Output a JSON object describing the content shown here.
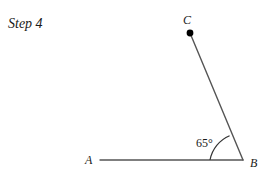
{
  "caption": {
    "text": "Step 4"
  },
  "figure": {
    "name": "angle-construction-65-degrees",
    "points": {
      "A": {
        "label": "A",
        "x": 100,
        "y": 160,
        "label_x": 85,
        "label_y": 164,
        "marker": false
      },
      "B": {
        "label": "B",
        "x": 243,
        "y": 160,
        "label_x": 250,
        "label_y": 167,
        "marker": false
      },
      "C": {
        "label": "C",
        "x": 190,
        "y": 33,
        "label_x": 183,
        "label_y": 24,
        "marker": true,
        "marker_radius": 3.4
      }
    },
    "segments": [
      {
        "name": "ray-BA",
        "from": "B",
        "to": "A"
      },
      {
        "name": "ray-BC",
        "from": "B",
        "to": "C"
      }
    ],
    "angle": {
      "label": "65°",
      "value": 65,
      "unit": "degrees",
      "vertex": "B",
      "label_x": 196,
      "label_y": 147,
      "arc_radius": 33,
      "arc_start_x": 210,
      "arc_start_y": 160,
      "arc_end_x": 229.6,
      "arc_end_y": 135.8
    },
    "colors": {
      "segment": "#555555",
      "arc": "#333333",
      "point": "#000000",
      "text": "#1a1a1a",
      "background": "#ffffff"
    }
  }
}
